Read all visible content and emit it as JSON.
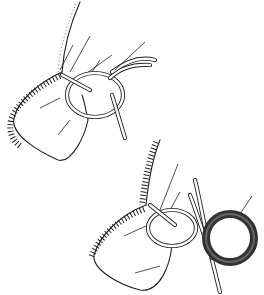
{
  "figure": {
    "panels": [
      {
        "id": "top",
        "label": "loose-knot-loop"
      },
      {
        "id": "bottom",
        "label": "knot-with-ring"
      }
    ],
    "colors": {
      "line": "#222222",
      "ring": "#333333",
      "background": "#ffffff"
    }
  }
}
